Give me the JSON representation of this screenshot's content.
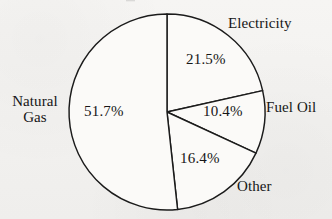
{
  "chart_data": {
    "type": "pie",
    "title": "",
    "xlabel": "",
    "ylabel": "",
    "legend_position": "none",
    "grid": false,
    "units": "percent",
    "total": 100.0,
    "start_angle_deg": 0,
    "direction": "clockwise",
    "categories": [
      "Electricity",
      "Fuel Oil",
      "Other",
      "Natural Gas"
    ],
    "values": [
      21.5,
      10.4,
      16.4,
      51.7
    ],
    "slices": [
      {
        "name": "Electricity",
        "label": "Electricity",
        "value_label": "21.5%",
        "value": 21.5,
        "start_angle_deg": 0.0,
        "end_angle_deg": 77.4,
        "fill": "#fbfaf8",
        "stroke": "#1b1b1b",
        "label_placement": "outside-upper-right",
        "value_placement": "inside"
      },
      {
        "name": "Fuel Oil",
        "label": "Fuel Oil",
        "value_label": "10.4%",
        "value": 10.4,
        "start_angle_deg": 77.4,
        "end_angle_deg": 114.8,
        "fill": "#fbfaf8",
        "stroke": "#1b1b1b",
        "label_placement": "outside-right",
        "value_placement": "inside"
      },
      {
        "name": "Other",
        "label": "Other",
        "value_label": "16.4%",
        "value": 16.4,
        "start_angle_deg": 114.8,
        "end_angle_deg": 173.8,
        "fill": "#fbfaf8",
        "stroke": "#1b1b1b",
        "label_placement": "outside-lower-right",
        "value_placement": "inside"
      },
      {
        "name": "Natural Gas",
        "label_line1": "Natural",
        "label_line2": "Gas",
        "label": "Natural Gas",
        "value_label": "51.7%",
        "value": 51.7,
        "start_angle_deg": 173.8,
        "end_angle_deg": 360.0,
        "fill": "#fbfaf8",
        "stroke": "#1b1b1b",
        "label_placement": "outside-left",
        "value_placement": "inside"
      }
    ],
    "geometry": {
      "center_x": 167,
      "center_y": 112,
      "radius": 98
    },
    "colors": {
      "slice_fill": "#fbfaf8",
      "outline": "#1b1b1b",
      "text": "#161616",
      "background": "#f4f3f1"
    }
  }
}
